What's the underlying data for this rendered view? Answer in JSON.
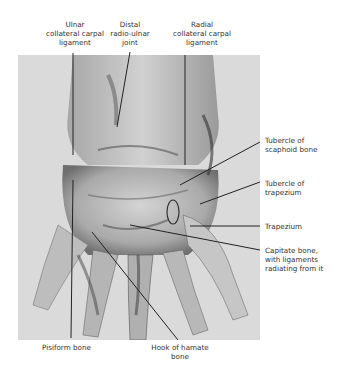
{
  "figure": {
    "labels": {
      "ulnar_collateral": [
        "Ulnar",
        "collateral carpal",
        "ligament"
      ],
      "distal_radioulnar": [
        "Distal",
        "radio-ulnar",
        "joint"
      ],
      "radial_collateral": [
        "Radial",
        "collateral carpal",
        "ligament"
      ],
      "tubercle_scaphoid": [
        "Tubercle of",
        "scaphoid bone"
      ],
      "tubercle_trapezium": [
        "Tubercle of",
        "trapezium"
      ],
      "trapezium": [
        "Trapezium"
      ],
      "capitate": [
        "Capitate bone,",
        "with ligaments",
        "radiating from it"
      ],
      "pisiform": [
        "Pisiform bone"
      ],
      "hook_hamate": [
        "Hook of hamate",
        "bone"
      ]
    }
  }
}
